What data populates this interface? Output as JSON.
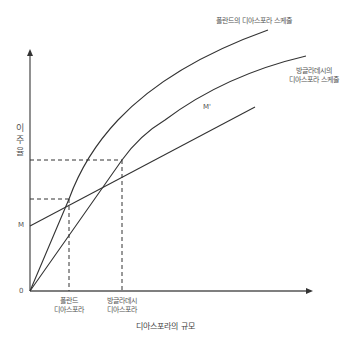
{
  "diagram": {
    "y_axis_label_chars": [
      "이",
      "주",
      "율"
    ],
    "x_axis_title": "디아스포라의 규모",
    "origin_label": "0",
    "m_label": "M",
    "m_prime_label": "M'",
    "curves": {
      "poland_label": "폴란드의 디아스포라 스케줄",
      "bangladesh_label_line1": "방글라데시의",
      "bangladesh_label_line2": "디아스포라 스케줄"
    },
    "x_ticks": {
      "poland_line1": "폴란드",
      "poland_line2": "디아스포라",
      "bangladesh_line1": "방글라데시",
      "bangladesh_line2": "디아스포라"
    },
    "colors": {
      "line": "#333333",
      "axis": "#555555",
      "text": "#555555"
    }
  }
}
